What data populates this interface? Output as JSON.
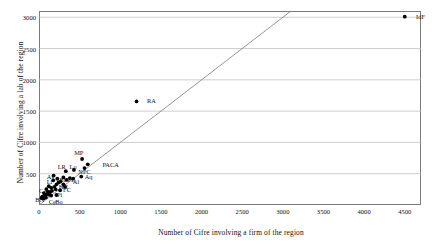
{
  "chart_data": {
    "type": "scatter",
    "title": "",
    "xlabel": "Number of Cifre involving a firm of the region",
    "ylabel": "Number of Cifre involving a lab of the region",
    "xlim": [
      0,
      4700
    ],
    "ylim": [
      0,
      3100
    ],
    "xticks": [
      0,
      500,
      1000,
      1500,
      2000,
      2500,
      3000,
      3500,
      4000,
      4500
    ],
    "yticks": [
      500,
      1000,
      1500,
      2000,
      2500,
      3000
    ],
    "grid": "horizontal",
    "legend": "none",
    "reference_line": {
      "name": "y = x diagonal",
      "from": [
        0,
        0
      ],
      "to": [
        3100,
        3100
      ],
      "color": "#7b7b7b"
    },
    "marker_color": "#000000",
    "points": [
      {
        "label": "IdF",
        "x": 4500,
        "y": 3010
      },
      {
        "label": "RA",
        "x": 1200,
        "y": 1655
      },
      {
        "label": "MP",
        "x": 530,
        "y": 735
      },
      {
        "label": "PACA",
        "x": 600,
        "y": 650
      },
      {
        "label": "NPC",
        "x": 560,
        "y": 590
      },
      {
        "label": "Lo",
        "x": 430,
        "y": 560
      },
      {
        "label": "LR",
        "x": 330,
        "y": 540
      },
      {
        "label": "Aq",
        "x": 520,
        "y": 455
      },
      {
        "label": "Al",
        "x": 420,
        "y": 420
      },
      {
        "label": "Br",
        "x": 300,
        "y": 440
      },
      {
        "label": "PL",
        "x": 380,
        "y": 430
      },
      {
        "label": "Al2",
        "x": 340,
        "y": 400
      },
      {
        "label": "As",
        "x": 180,
        "y": 470
      },
      {
        "label": "Li",
        "x": 175,
        "y": 395
      },
      {
        "label": "HN",
        "x": 300,
        "y": 330
      },
      {
        "label": "FC",
        "x": 320,
        "y": 290
      },
      {
        "label": "Pi",
        "x": 260,
        "y": 235
      },
      {
        "label": "CA",
        "x": 90,
        "y": 255
      },
      {
        "label": "Ce",
        "x": 150,
        "y": 150
      },
      {
        "label": "Bo",
        "x": 215,
        "y": 160
      },
      {
        "label": "BN",
        "x": 30,
        "y": 110
      },
      {
        "label": "c1",
        "x": 120,
        "y": 300
      },
      {
        "label": "c2",
        "x": 150,
        "y": 275
      },
      {
        "label": "c3",
        "x": 190,
        "y": 290
      },
      {
        "label": "c4",
        "x": 215,
        "y": 330
      },
      {
        "label": "c5",
        "x": 240,
        "y": 360
      },
      {
        "label": "c6",
        "x": 110,
        "y": 215
      },
      {
        "label": "c7",
        "x": 135,
        "y": 205
      },
      {
        "label": "c8",
        "x": 160,
        "y": 225
      },
      {
        "label": "c9",
        "x": 100,
        "y": 175
      },
      {
        "label": "c10",
        "x": 125,
        "y": 165
      },
      {
        "label": "c11",
        "x": 75,
        "y": 160
      },
      {
        "label": "c12",
        "x": 60,
        "y": 190
      },
      {
        "label": "c13",
        "x": 85,
        "y": 120
      },
      {
        "label": "c14",
        "x": 55,
        "y": 105
      },
      {
        "label": "c15",
        "x": 40,
        "y": 135
      },
      {
        "label": "c16",
        "x": 205,
        "y": 250
      },
      {
        "label": "c17",
        "x": 265,
        "y": 375
      },
      {
        "label": "c18",
        "x": 225,
        "y": 420
      }
    ],
    "visible_labels": [
      {
        "text": "IdF",
        "x": 4640,
        "y": 3010,
        "anchor": "left"
      },
      {
        "text": "RA",
        "x": 1330,
        "y": 1655,
        "anchor": "left"
      },
      {
        "text": "MP",
        "x": 490,
        "y": 830,
        "anchor": "center"
      },
      {
        "text": "PACA",
        "x": 780,
        "y": 645,
        "anchor": "left"
      },
      {
        "text": "NPC",
        "x": 560,
        "y": 520,
        "anchor": "center"
      },
      {
        "text": "Lo",
        "x": 420,
        "y": 610,
        "anchor": "center"
      },
      {
        "text": "LR",
        "x": 280,
        "y": 610,
        "anchor": "center"
      },
      {
        "text": "Aq",
        "x": 610,
        "y": 440,
        "anchor": "center"
      },
      {
        "text": "Al",
        "x": 455,
        "y": 360,
        "anchor": "center"
      },
      {
        "text": "Br",
        "x": 290,
        "y": 400,
        "anchor": "center"
      },
      {
        "text": "PL",
        "x": 400,
        "y": 395,
        "anchor": "center"
      },
      {
        "text": "As",
        "x": 140,
        "y": 450,
        "anchor": "center"
      },
      {
        "text": "Li",
        "x": 130,
        "y": 370,
        "anchor": "center"
      },
      {
        "text": "HN",
        "x": 300,
        "y": 290,
        "anchor": "center"
      },
      {
        "text": "FC",
        "x": 345,
        "y": 235,
        "anchor": "center"
      },
      {
        "text": "Pi",
        "x": 255,
        "y": 165,
        "anchor": "center"
      },
      {
        "text": "CA",
        "x": 55,
        "y": 225,
        "anchor": "center"
      },
      {
        "text": "Ce",
        "x": 165,
        "y": 55,
        "anchor": "center"
      },
      {
        "text": "Bo",
        "x": 245,
        "y": 55,
        "anchor": "center"
      },
      {
        "text": "BN",
        "x": 10,
        "y": 80,
        "anchor": "center"
      }
    ]
  }
}
